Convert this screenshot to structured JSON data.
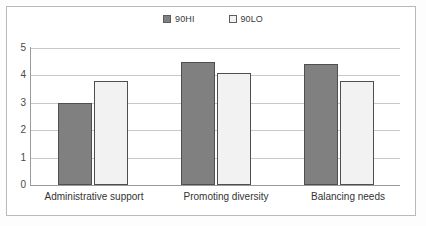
{
  "chart_data": {
    "type": "bar",
    "title": "",
    "xlabel": "",
    "ylabel": "",
    "ylim": [
      0,
      5
    ],
    "yticks": [
      "0",
      "1",
      "2",
      "3",
      "4",
      "5"
    ],
    "grid": true,
    "legend_position": "top-center",
    "categories": [
      "Administrative support",
      "Promoting diversity",
      "Balancing needs"
    ],
    "series": [
      {
        "name": "90HI",
        "color": "#808080",
        "values": [
          3.0,
          4.5,
          4.4
        ]
      },
      {
        "name": "90LO",
        "color": "#F2F2F2",
        "values": [
          3.8,
          4.1,
          3.8
        ]
      }
    ]
  },
  "legend": {
    "items": [
      {
        "label": "90HI",
        "swatch": "filled-gray-square-icon"
      },
      {
        "label": "90LO",
        "swatch": "outlined-white-square-icon"
      }
    ]
  },
  "axis": {
    "y_tick_5": "5",
    "y_tick_4": "4",
    "y_tick_3": "3",
    "y_tick_2": "2",
    "y_tick_1": "1",
    "y_tick_0": "0"
  },
  "categories": {
    "c0": "Administrative support",
    "c1": "Promoting diversity",
    "c2": "Balancing needs"
  }
}
